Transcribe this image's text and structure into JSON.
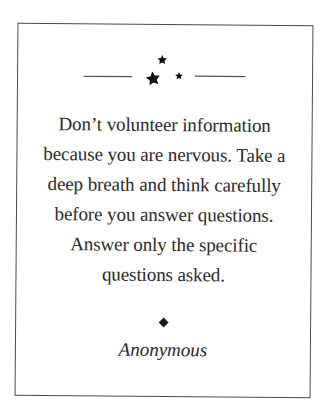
{
  "card": {
    "quote_lines": [
      "Don’t volunteer information",
      "because you are nervous. Take a",
      "deep breath and think carefully",
      "before you answer questions.",
      "Answer only the specific",
      "questions asked."
    ],
    "author": "Anonymous",
    "ornament": {
      "icons": [
        "star-icon",
        "star-icon",
        "star-icon"
      ],
      "divider": "diamond-icon"
    },
    "colors": {
      "text": "#2a2a2a",
      "border": "#4a4a4a",
      "background": "#ffffff"
    }
  }
}
